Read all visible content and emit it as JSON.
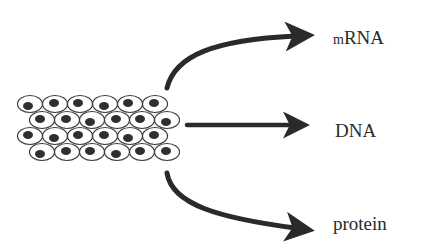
{
  "diagram": {
    "source": {
      "name": "cell tissue",
      "rows": 4,
      "cells_per_row": 6
    },
    "arrows": [
      {
        "direction": "up-right",
        "target": "mRNA"
      },
      {
        "direction": "right",
        "target": "DNA"
      },
      {
        "direction": "down-right",
        "target": "protein"
      }
    ],
    "labels": {
      "mrna_prefix": "m",
      "mrna_main": "RNA",
      "dna": "DNA",
      "protein": "protein"
    },
    "colors": {
      "ink": "#2a2a2a",
      "background": "#ffffff"
    }
  }
}
